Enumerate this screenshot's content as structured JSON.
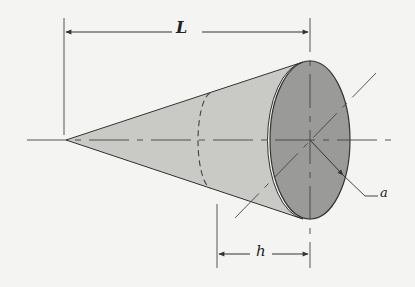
{
  "diagram": {
    "labels": {
      "length": "L",
      "section_distance": "h",
      "radius": "a"
    },
    "colors": {
      "background": "#f4f4f2",
      "cone_side": "#c9c9c6",
      "base_face": "#9a9a98",
      "line": "#333333"
    }
  }
}
